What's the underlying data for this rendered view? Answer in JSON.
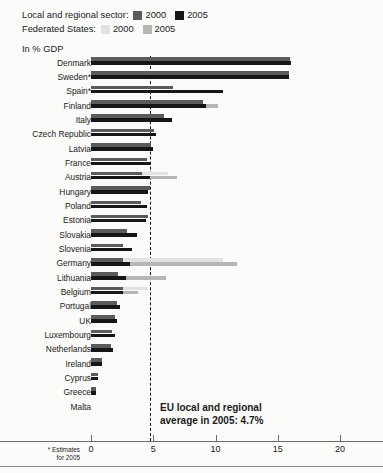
{
  "legend": {
    "rows": [
      {
        "title": "Local and regional sector:",
        "entries": [
          {
            "label": "2000",
            "color": "#5b5b5b",
            "key": "lr2000"
          },
          {
            "label": "2005",
            "color": "#161616",
            "key": "lr2005"
          }
        ]
      },
      {
        "title": "Federated States:",
        "entries": [
          {
            "label": "2000",
            "color": "#e2e2e2",
            "key": "fs2000"
          },
          {
            "label": "2005",
            "color": "#b6b6b6",
            "key": "fs2005"
          }
        ]
      }
    ]
  },
  "axis_title": "In % GDP",
  "annotation": {
    "line1": "EU local and regional",
    "line2": "average in 2005: 4.7%"
  },
  "footnote": {
    "line1": "* Estimates",
    "line2": "for 2005"
  },
  "chart_data": {
    "type": "bar",
    "subtitle": "In % GDP",
    "xlabel": "",
    "ylabel": "",
    "orientation": "horizontal",
    "xlim": [
      0,
      20
    ],
    "xticks": [
      0,
      5,
      10,
      15,
      20
    ],
    "xtick_labels": [
      "0",
      "5",
      "10",
      "15",
      "20"
    ],
    "grid": false,
    "legend_position": "top-left",
    "reference_line": {
      "value": 4.7,
      "label": "EU local and regional average in 2005: 4.7%",
      "style": "dashed"
    },
    "categories": [
      "Denmark",
      "Sweden*",
      "Spain*",
      "Finland",
      "Italy",
      "Czech Republic",
      "Latvia",
      "France",
      "Austria",
      "Hungary",
      "Poland",
      "Estonia",
      "Slovakia",
      "Slovenia",
      "Germany",
      "Lithuania",
      "Belgium",
      "Portugal",
      "UK",
      "Luxembourg",
      "Netherlands",
      "Ireland",
      "Cyprus",
      "Greece",
      "Malta"
    ],
    "series": [
      {
        "name": "Local and regional sector 2000",
        "color": "#5b5b5b",
        "values": [
          16.0,
          15.9,
          6.6,
          9.0,
          5.9,
          5.1,
          4.8,
          4.5,
          4.1,
          4.7,
          4.0,
          4.6,
          2.9,
          2.6,
          2.6,
          2.2,
          2.6,
          2.1,
          1.9,
          1.7,
          1.6,
          0.9,
          0.6,
          0.4,
          0.0
        ]
      },
      {
        "name": "Local and regional sector 2005",
        "color": "#161616",
        "values": [
          16.1,
          15.9,
          10.6,
          9.2,
          6.5,
          5.2,
          5.0,
          4.8,
          4.7,
          4.6,
          4.5,
          4.4,
          3.7,
          3.3,
          3.1,
          2.8,
          2.6,
          2.3,
          2.1,
          1.9,
          1.8,
          0.9,
          0.6,
          0.4,
          0.0
        ]
      },
      {
        "name": "Federated States 2000",
        "color": "#e2e2e2",
        "values": [
          0,
          0,
          0,
          0,
          0,
          0,
          0,
          0,
          6.2,
          0,
          0,
          0,
          0,
          0,
          10.6,
          0,
          4.5,
          0,
          0,
          0,
          0,
          0,
          0,
          0,
          0
        ]
      },
      {
        "name": "Federated States 2005",
        "color": "#b6b6b6",
        "values": [
          0,
          0,
          8.5,
          10.2,
          0,
          0,
          0,
          0,
          6.9,
          0,
          0,
          0,
          0,
          0,
          11.7,
          6.0,
          3.8,
          0,
          0,
          0,
          0,
          0,
          0,
          0,
          0
        ]
      }
    ]
  }
}
